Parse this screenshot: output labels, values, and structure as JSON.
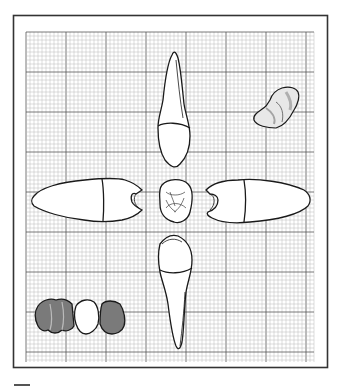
{
  "figure": {
    "type": "dental-illustration",
    "background": "#ffffff",
    "frame_color": "#333333",
    "grid": {
      "left": 26,
      "top": 32,
      "right": 314,
      "bottom": 362,
      "minor_step": 4,
      "major_every": 10,
      "minor_color": "#b8b8b8",
      "major_color": "#555555"
    },
    "colors": {
      "outline": "#1a1a1a",
      "tooth_fill": "#ffffff",
      "shaded_crown": "#7a7a7a",
      "shaded_crown_light": "#a8a8a8"
    },
    "views": [
      {
        "name": "top-view"
      },
      {
        "name": "left-view"
      },
      {
        "name": "center-occlusal-view"
      },
      {
        "name": "right-view"
      },
      {
        "name": "bottom-view"
      },
      {
        "name": "upper-right-occlusal-detail"
      },
      {
        "name": "lower-left-bridge"
      }
    ]
  }
}
